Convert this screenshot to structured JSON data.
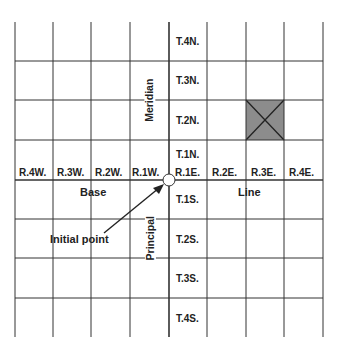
{
  "diagram": {
    "grid": {
      "columns": 8,
      "rows": 8,
      "highlighted_cell": {
        "range": "R.3E.",
        "township": "T.2N.",
        "fill": "#8c8c8c",
        "marker": "X"
      }
    },
    "range_labels_west": [
      "R.4W.",
      "R.3W.",
      "R.2W.",
      "R.1W."
    ],
    "range_labels_east": [
      "R.1E.",
      "R.2E.",
      "R.3E.",
      "R.4E."
    ],
    "township_labels_north": [
      "T.4N.",
      "T.3N.",
      "T.2N.",
      "T.1N."
    ],
    "township_labels_south": [
      "T.1S.",
      "T.2S.",
      "T.3S.",
      "T.4S."
    ],
    "line_labels": {
      "meridian": "Meridian",
      "principal": "Principal",
      "base": "Base",
      "line": "Line"
    },
    "annotation": {
      "initial_point": "Initial point"
    },
    "colors": {
      "line": "#333333",
      "highlight": "#8c8c8c"
    }
  }
}
